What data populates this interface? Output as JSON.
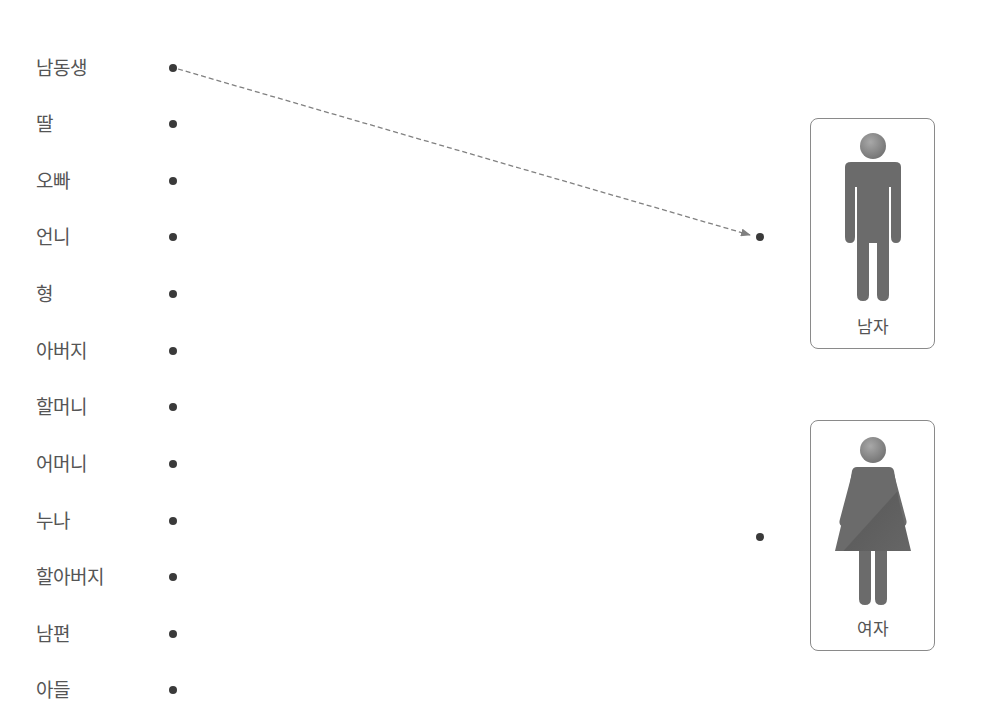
{
  "header": {
    "instruction_cut_off": ""
  },
  "left_items": [
    {
      "label": "남동생",
      "y": 68
    },
    {
      "label": "딸",
      "y": 124
    },
    {
      "label": "오빠",
      "y": 181
    },
    {
      "label": "언니",
      "y": 237
    },
    {
      "label": "형",
      "y": 294
    },
    {
      "label": "아버지",
      "y": 351
    },
    {
      "label": "할머니",
      "y": 407
    },
    {
      "label": "어머니",
      "y": 464
    },
    {
      "label": "누나",
      "y": 521
    },
    {
      "label": "할아버지",
      "y": 577
    },
    {
      "label": "남편",
      "y": 634
    },
    {
      "label": "아들",
      "y": 690
    }
  ],
  "targets": {
    "male": {
      "label": "남자",
      "dot_y": 237
    },
    "female": {
      "label": "여자",
      "dot_y": 537
    }
  },
  "connections": [
    {
      "from": "남동생",
      "to": "남자",
      "style": "dashed-arrow"
    }
  ],
  "colors": {
    "figure": "#6b6b6b",
    "head": "#8c8c8c",
    "line": "#808080",
    "dot": "#3a3a3a"
  }
}
